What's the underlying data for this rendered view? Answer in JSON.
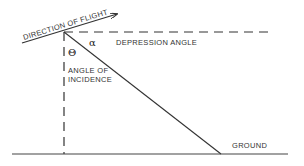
{
  "diagram": {
    "labels": {
      "direction_of_flight": "DIRECTION OF FLIGHT",
      "depression_angle": "DEPRESSION ANGLE",
      "angle_of_incidence_line1": "ANGLE OF",
      "angle_of_incidence_line2": "INCIDENCE",
      "ground": "GROUND",
      "alpha_symbol": "α",
      "theta_symbol": "Θ"
    },
    "colors": {
      "line": "#333333",
      "background": "#ffffff"
    }
  }
}
